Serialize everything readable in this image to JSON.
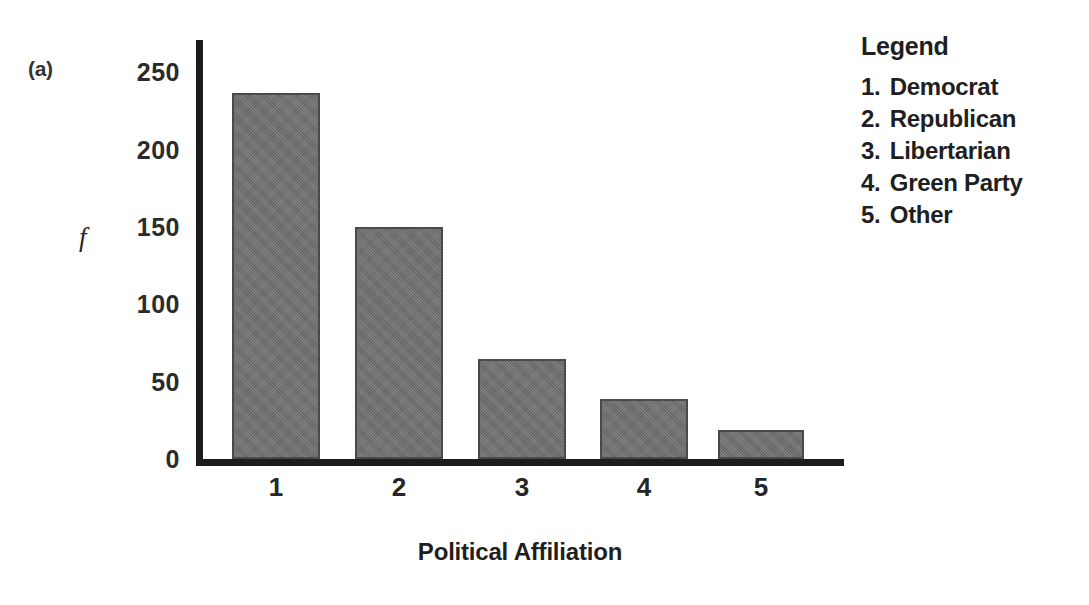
{
  "figure": {
    "panel_label": "(a)",
    "x_axis_title": "Political Affiliation",
    "y_axis_symbol": "f"
  },
  "legend": {
    "title": "Legend",
    "items": [
      {
        "number": "1.",
        "label": "Democrat"
      },
      {
        "number": "2.",
        "label": "Republican"
      },
      {
        "number": "3.",
        "label": "Libertarian"
      },
      {
        "number": "4.",
        "label": "Green Party"
      },
      {
        "number": "5.",
        "label": "Other"
      }
    ]
  },
  "style": {
    "bar_fill": "#6e6e6e",
    "bar_border": "#4a4a4a",
    "axis_color": "#1c1c1c",
    "text_color": "#1f1f1f",
    "background": "#ffffff"
  },
  "chart_data": {
    "type": "bar",
    "title": "",
    "subtitle": "",
    "xlabel": "Political Affiliation",
    "ylabel": "f",
    "categories": [
      "1",
      "2",
      "3",
      "4",
      "5"
    ],
    "category_names": [
      "Democrat",
      "Republican",
      "Libertarian",
      "Green Party",
      "Other"
    ],
    "values": [
      237,
      150,
      65,
      39,
      19
    ],
    "ylim": [
      0,
      250
    ],
    "yticks": [
      250,
      200,
      150,
      100,
      50,
      0
    ],
    "ytick_labels": [
      "250",
      "200",
      "150",
      "100",
      "50",
      "0"
    ],
    "xtick_labels": [
      "1",
      "2",
      "3",
      "4",
      "5"
    ],
    "grid": false,
    "legend_position": "right",
    "legend_entries": [
      "1. Democrat",
      "2. Republican",
      "3. Libertarian",
      "4. Green Party",
      "5. Other"
    ],
    "annotations": [
      "(a)"
    ]
  },
  "geometry": {
    "plot_left": 196,
    "plot_top": 40,
    "plot_width": 648,
    "plot_height": 426,
    "baseline_offset": 7,
    "y_axis_top_value": 271,
    "bar_layout": [
      {
        "left": 36,
        "width": 88
      },
      {
        "left": 159,
        "width": 88
      },
      {
        "left": 282,
        "width": 88
      },
      {
        "left": 404,
        "width": 88
      },
      {
        "left": 522,
        "width": 86
      }
    ],
    "xtick_centers": [
      80,
      203,
      326,
      448,
      565
    ]
  }
}
